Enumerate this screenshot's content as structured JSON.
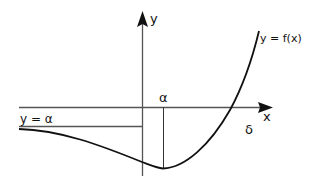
{
  "diagram": {
    "labels": {
      "y_axis": "y",
      "x_axis": "x",
      "curve": "y = f(x)",
      "asymptote": "y = α",
      "alpha_point": "α",
      "delta_point": "δ"
    },
    "colors": {
      "axis": "#555555",
      "curve": "#111111",
      "line": "#333333",
      "text": "#111111"
    }
  }
}
